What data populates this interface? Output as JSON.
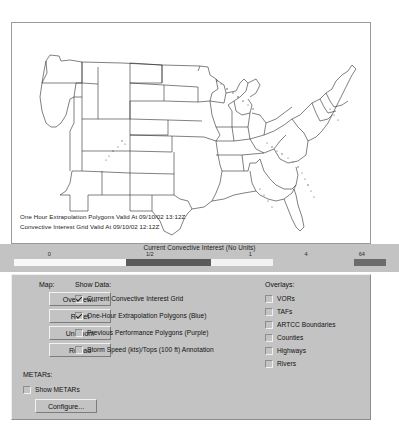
{
  "map": {
    "name": "convective-weather-map",
    "captions": [
      "One Hour Extrapolation Polygons Valid At 09/10/02 13:12Z",
      "Convective Interest Grid Valid At 09/10/02 12:12Z"
    ]
  },
  "colorbar": {
    "title": "Current Convective Interest (No Units)",
    "ticks": [
      {
        "label": "0",
        "pos": 9.5
      },
      {
        "label": "1/2",
        "pos": 36.5
      },
      {
        "label": "1",
        "pos": 63.5
      },
      {
        "label": "4",
        "pos": 78.5
      },
      {
        "label": "64",
        "pos": 93.5
      }
    ],
    "segments": [
      {
        "start": 0.0,
        "width": 30.0,
        "color": "#f8f8f8"
      },
      {
        "start": 30.0,
        "width": 23.0,
        "color": "#5b5b5b"
      },
      {
        "start": 53.0,
        "width": 16.5,
        "color": "#f2f2f2"
      },
      {
        "start": 69.5,
        "width": 22.0,
        "color": "#c3c3c3"
      },
      {
        "start": 91.5,
        "width": 8.5,
        "color": "#6b6b6b"
      }
    ]
  },
  "controls": {
    "map_group": {
      "label": "Map:",
      "buttons": [
        {
          "label": "Overview...",
          "name": "overview-button"
        },
        {
          "label": "Reset",
          "name": "reset-button"
        },
        {
          "label": "Un-zoom",
          "name": "unzoom-button"
        },
        {
          "label": "Reload",
          "name": "reload-button"
        }
      ]
    },
    "show_data_group": {
      "label": "Show Data:",
      "items": [
        {
          "label": "Current Convective Interest Grid",
          "checked": true
        },
        {
          "label": "One-Hour Extrapolation Polygons (Blue)",
          "checked": true
        },
        {
          "label": "Previous Performance Polygons (Purple)",
          "checked": false
        },
        {
          "label": "Storm Speed (kts)/Tops (100 ft) Annotation",
          "checked": false
        }
      ]
    },
    "overlays_group": {
      "label": "Overlays:",
      "items": [
        {
          "label": "VORs",
          "checked": false
        },
        {
          "label": "TAFs",
          "checked": false
        },
        {
          "label": "ARTCC Boundaries",
          "checked": false
        },
        {
          "label": "Counties",
          "checked": false
        },
        {
          "label": "Highways",
          "checked": false
        },
        {
          "label": "Rivers",
          "checked": false
        }
      ]
    },
    "metars_group": {
      "label": "METARs:",
      "checkbox": {
        "label": "Show METARs",
        "checked": false
      },
      "button": {
        "label": "Configure...",
        "name": "configure-button"
      }
    }
  },
  "theme": {
    "panel_bg": "#c3c3c3",
    "map_bg": "#ffffff",
    "text": "#111111"
  }
}
